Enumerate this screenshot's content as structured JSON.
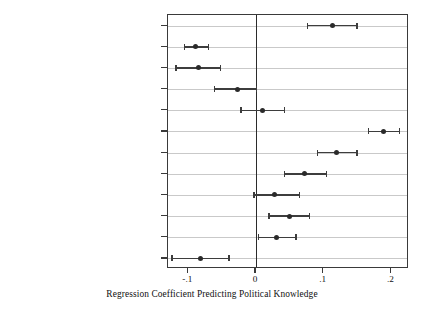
{
  "chart_data": {
    "type": "scatter",
    "title": "",
    "subtitle": "",
    "xlabel": "Regression Coefficient Predicting Political Knowledge",
    "ylabel": "",
    "xlim": [
      -0.13,
      0.226
    ],
    "ylim": [
      0,
      13
    ],
    "xticks": [
      -0.1,
      0,
      0.1,
      0.2
    ],
    "xticklabels": [
      "-.1",
      "0",
      ".1",
      ".2"
    ],
    "grid": "horizontal",
    "legend": "none",
    "reference_line": 0,
    "categories": [
      "Age (in years)",
      "Female (0, 1)",
      "Black (0, 1)",
      "Hispanic (0, 1)",
      "Race-other (0, 1)",
      "Education",
      "Political Interest",
      "Independent Leaner (0, 1)",
      "Weak Partisan (0, 1)",
      "Strong Partisan (0, 1)",
      "External Efficacy (Low to High)",
      "Corrupt Government (Low to High)"
    ],
    "values": [
      0.113,
      -0.09,
      -0.085,
      -0.028,
      0.01,
      0.188,
      0.119,
      0.072,
      0.027,
      0.049,
      0.031,
      -0.082
    ],
    "ci_low": [
      0.076,
      -0.106,
      -0.118,
      -0.061,
      -0.022,
      0.166,
      0.091,
      0.042,
      -0.003,
      0.019,
      0.004,
      -0.124
    ],
    "ci_high": [
      0.149,
      -0.07,
      -0.052,
      0.001,
      0.042,
      0.212,
      0.149,
      0.104,
      0.064,
      0.079,
      0.059,
      -0.04
    ],
    "series": [
      {
        "name": "Regression coefficient",
        "points": [
          {
            "label": "Age (in years)",
            "estimate": 0.113,
            "ci_low": 0.076,
            "ci_high": 0.149
          },
          {
            "label": "Female (0, 1)",
            "estimate": -0.09,
            "ci_low": -0.106,
            "ci_high": -0.07
          },
          {
            "label": "Black (0, 1)",
            "estimate": -0.085,
            "ci_low": -0.118,
            "ci_high": -0.052
          },
          {
            "label": "Hispanic (0, 1)",
            "estimate": -0.028,
            "ci_low": -0.061,
            "ci_high": 0.001
          },
          {
            "label": "Race-other (0, 1)",
            "estimate": 0.01,
            "ci_low": -0.022,
            "ci_high": 0.042
          },
          {
            "label": "Education",
            "estimate": 0.188,
            "ci_low": 0.166,
            "ci_high": 0.212
          },
          {
            "label": "Political Interest",
            "estimate": 0.119,
            "ci_low": 0.091,
            "ci_high": 0.149
          },
          {
            "label": "Independent Leaner (0, 1)",
            "estimate": 0.072,
            "ci_low": 0.042,
            "ci_high": 0.104
          },
          {
            "label": "Weak Partisan (0, 1)",
            "estimate": 0.027,
            "ci_low": -0.003,
            "ci_high": 0.064
          },
          {
            "label": "Strong Partisan (0, 1)",
            "estimate": 0.049,
            "ci_low": 0.019,
            "ci_high": 0.079
          },
          {
            "label": "External Efficacy (Low to High)",
            "estimate": 0.031,
            "ci_low": 0.004,
            "ci_high": 0.059
          },
          {
            "label": "Corrupt Government (Low to High)",
            "estimate": -0.082,
            "ci_low": -0.124,
            "ci_high": -0.04
          }
        ]
      }
    ],
    "colors": {
      "point": "#2a2a2a",
      "interval": "#3d3d3d",
      "gridline": "#c9c9c9",
      "frame": "#3a3a3a",
      "reference_line": "#2b2b2b",
      "background": "#ffffff",
      "text": "#111111"
    }
  }
}
